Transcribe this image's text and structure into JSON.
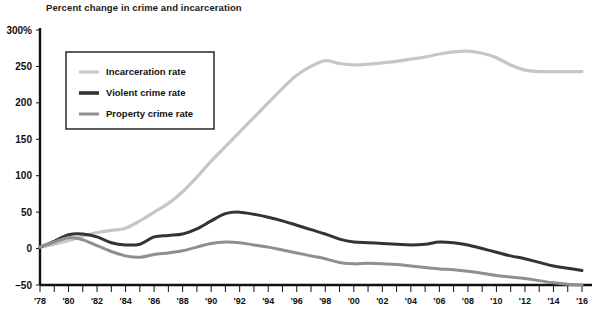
{
  "chart_data": {
    "type": "line",
    "title": "Percent change in crime and incarceration",
    "xlabel": "",
    "ylabel": "",
    "ylim": [
      -50,
      300
    ],
    "xlim": [
      1978,
      2016
    ],
    "grid": false,
    "legend_position": "upper-left",
    "y_ticks": [
      {
        "value": 300,
        "label": "300%"
      },
      {
        "value": 250,
        "label": "250"
      },
      {
        "value": 200,
        "label": "200"
      },
      {
        "value": 150,
        "label": "150"
      },
      {
        "value": 100,
        "label": "100"
      },
      {
        "value": 50,
        "label": "50"
      },
      {
        "value": 0,
        "label": "0"
      },
      {
        "value": -50,
        "label": "–50"
      }
    ],
    "x_ticks": [
      {
        "value": 1978,
        "label": "'78"
      },
      {
        "value": 1979,
        "label": ""
      },
      {
        "value": 1980,
        "label": "'80"
      },
      {
        "value": 1981,
        "label": ""
      },
      {
        "value": 1982,
        "label": "'82"
      },
      {
        "value": 1983,
        "label": ""
      },
      {
        "value": 1984,
        "label": "'84"
      },
      {
        "value": 1985,
        "label": ""
      },
      {
        "value": 1986,
        "label": "'86"
      },
      {
        "value": 1987,
        "label": ""
      },
      {
        "value": 1988,
        "label": "'88"
      },
      {
        "value": 1989,
        "label": ""
      },
      {
        "value": 1990,
        "label": "'90"
      },
      {
        "value": 1991,
        "label": ""
      },
      {
        "value": 1992,
        "label": "'92"
      },
      {
        "value": 1993,
        "label": ""
      },
      {
        "value": 1994,
        "label": "'94"
      },
      {
        "value": 1995,
        "label": ""
      },
      {
        "value": 1996,
        "label": "'96"
      },
      {
        "value": 1997,
        "label": ""
      },
      {
        "value": 1998,
        "label": "'98"
      },
      {
        "value": 1999,
        "label": ""
      },
      {
        "value": 2000,
        "label": "'00"
      },
      {
        "value": 2001,
        "label": ""
      },
      {
        "value": 2002,
        "label": "'02"
      },
      {
        "value": 2003,
        "label": ""
      },
      {
        "value": 2004,
        "label": "'04"
      },
      {
        "value": 2005,
        "label": ""
      },
      {
        "value": 2006,
        "label": "'06"
      },
      {
        "value": 2007,
        "label": ""
      },
      {
        "value": 2008,
        "label": "'08"
      },
      {
        "value": 2009,
        "label": ""
      },
      {
        "value": 2010,
        "label": "'10"
      },
      {
        "value": 2011,
        "label": ""
      },
      {
        "value": 2012,
        "label": "'12"
      },
      {
        "value": 2013,
        "label": ""
      },
      {
        "value": 2014,
        "label": "'14"
      },
      {
        "value": 2015,
        "label": ""
      },
      {
        "value": 2016,
        "label": "'16"
      }
    ],
    "x": [
      1978,
      1979,
      1980,
      1981,
      1982,
      1983,
      1984,
      1985,
      1986,
      1987,
      1988,
      1989,
      1990,
      1991,
      1992,
      1993,
      1994,
      1995,
      1996,
      1997,
      1998,
      1999,
      2000,
      2001,
      2002,
      2003,
      2004,
      2005,
      2006,
      2007,
      2008,
      2009,
      2010,
      2011,
      2012,
      2013,
      2014,
      2015,
      2016
    ],
    "series": [
      {
        "name": "Incarceration rate",
        "color": "#c6c6c6",
        "width": 3.2,
        "values": [
          2,
          6,
          11,
          17,
          22,
          25,
          28,
          38,
          50,
          62,
          78,
          98,
          120,
          140,
          160,
          180,
          200,
          220,
          238,
          250,
          258,
          254,
          252,
          253,
          255,
          257,
          260,
          263,
          267,
          270,
          271,
          268,
          262,
          252,
          245,
          243,
          243,
          243,
          243
        ]
      },
      {
        "name": "Violent crime rate",
        "color": "#333333",
        "width": 3.0,
        "values": [
          2,
          10,
          19,
          20,
          16,
          8,
          5,
          6,
          16,
          18,
          20,
          27,
          38,
          48,
          50,
          47,
          43,
          38,
          32,
          26,
          20,
          13,
          9,
          8,
          7,
          6,
          5,
          6,
          9,
          8,
          5,
          0,
          -5,
          -10,
          -14,
          -19,
          -24,
          -27,
          -30
        ]
      },
      {
        "name": "Property crime rate",
        "color": "#8f8f8f",
        "width": 3.0,
        "values": [
          2,
          9,
          15,
          12,
          4,
          -4,
          -10,
          -12,
          -8,
          -6,
          -3,
          2,
          7,
          9,
          8,
          5,
          2,
          -2,
          -6,
          -10,
          -14,
          -19,
          -21,
          -20,
          -21,
          -22,
          -24,
          -26,
          -28,
          -29,
          -31,
          -34,
          -37,
          -39,
          -41,
          -44,
          -47,
          -49,
          -50
        ]
      }
    ]
  },
  "axes": {
    "y_axis_name": "percent-change-axis",
    "x_axis_name": "year-axis"
  }
}
